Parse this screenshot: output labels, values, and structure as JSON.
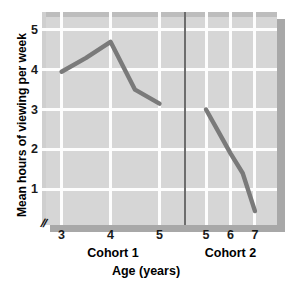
{
  "chart_data": {
    "type": "line",
    "title": "",
    "xlabel": "Age (years)",
    "ylabel": "Mean hours of viewing per week",
    "xlim": [
      2.6,
      7.4
    ],
    "ylim": [
      0.1,
      5.45
    ],
    "grid": true,
    "legend_position": "none",
    "panel_background": "#d6d6d6",
    "gridline_color": "#fdfdfd",
    "series_color": "#7a7a7a",
    "divider_color": "#6d6d6d",
    "divider_x": 5.5,
    "axis_break_symbol": "//",
    "x_ticks": [
      {
        "value": 3,
        "label": "3"
      },
      {
        "value": 4,
        "label": "4"
      },
      {
        "value": 5,
        "label": "5"
      },
      {
        "value": 5.5,
        "label": ""
      },
      {
        "value": 5.95,
        "label": "5"
      },
      {
        "value": 6.45,
        "label": "6"
      },
      {
        "value": 6.95,
        "label": "7"
      }
    ],
    "y_ticks": [
      {
        "value": 1,
        "label": "1"
      },
      {
        "value": 2,
        "label": "2"
      },
      {
        "value": 3,
        "label": "3"
      },
      {
        "value": 4,
        "label": "4"
      },
      {
        "value": 5,
        "label": "5"
      }
    ],
    "group_labels": [
      {
        "label": "Cohort 1",
        "center_x": 4.05
      },
      {
        "label": "Cohort 2",
        "center_x": 6.45
      }
    ],
    "series": [
      {
        "name": "Cohort 1",
        "x": [
          3.0,
          3.5,
          4.0,
          4.5,
          5.0
        ],
        "values": [
          3.95,
          4.3,
          4.7,
          3.5,
          3.15
        ]
      },
      {
        "name": "Cohort 2",
        "x": [
          5.95,
          6.2,
          6.45,
          6.7,
          6.95
        ],
        "values": [
          3.0,
          2.45,
          1.9,
          1.4,
          0.45
        ]
      }
    ]
  }
}
